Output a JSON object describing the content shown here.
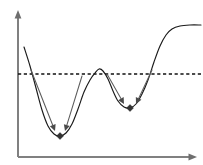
{
  "figure": {
    "width": 203,
    "height": 165,
    "background_color": "#ffffff"
  },
  "axes": {
    "x_axis": {
      "label": "x-axis",
      "color": "#808080",
      "start": [
        18,
        157
      ],
      "end": [
        193,
        157
      ],
      "arrow_head": "right-arrow-icon"
    },
    "y_axis": {
      "label": "y-axis",
      "color": "#808080",
      "start": [
        18,
        157
      ],
      "end": [
        18,
        14
      ],
      "arrow_head": "up-arrow-icon"
    }
  },
  "threshold": {
    "label": "threshold-level",
    "style": "dashed",
    "color": "#111111",
    "y_value": 74,
    "x_start": 18,
    "x_end": 201
  },
  "chart_data": {
    "type": "line",
    "xlabel": "",
    "ylabel": "",
    "grid": false,
    "legend_position": "none",
    "xlim": [
      18,
      201
    ],
    "ylim": [
      157,
      14
    ],
    "series": [
      {
        "name": "objective-function",
        "color": "#1a1a1a",
        "points": [
          [
            24,
            47
          ],
          [
            30,
            66
          ],
          [
            36,
            88
          ],
          [
            42,
            110
          ],
          [
            48,
            126
          ],
          [
            54,
            134
          ],
          [
            60,
            136
          ],
          [
            66,
            133
          ],
          [
            72,
            124
          ],
          [
            78,
            109
          ],
          [
            84,
            92
          ],
          [
            90,
            80
          ],
          [
            95,
            73
          ],
          [
            99,
            69
          ],
          [
            103,
            71
          ],
          [
            108,
            79
          ],
          [
            113,
            91
          ],
          [
            118,
            101
          ],
          [
            124,
            107
          ],
          [
            130,
            108
          ],
          [
            136,
            104
          ],
          [
            142,
            94
          ],
          [
            148,
            80
          ],
          [
            154,
            62
          ],
          [
            160,
            46
          ],
          [
            166,
            35
          ],
          [
            172,
            29
          ],
          [
            180,
            26
          ],
          [
            190,
            25
          ],
          [
            201,
            25
          ]
        ]
      }
    ],
    "markers": [
      {
        "name": "local-minimum-1",
        "x": 60,
        "y": 136,
        "shape": "diamond",
        "color": "#333333"
      },
      {
        "name": "local-minimum-2",
        "x": 130,
        "y": 108,
        "shape": "diamond",
        "color": "#333333"
      }
    ],
    "annotations": [
      {
        "name": "descent-arrow-left-basin-1",
        "from": [
          31,
          70
        ],
        "to": [
          55,
          131
        ],
        "color": "#5c5c5c",
        "direction": "down-right"
      },
      {
        "name": "descent-arrow-right-basin-1",
        "from": [
          82,
          76
        ],
        "to": [
          65,
          131
        ],
        "color": "#5c5c5c",
        "direction": "down-left"
      },
      {
        "name": "descent-arrow-left-basin-2",
        "from": [
          107,
          74
        ],
        "to": [
          124,
          104
        ],
        "color": "#5c5c5c",
        "direction": "down-right"
      },
      {
        "name": "descent-arrow-right-basin-2",
        "from": [
          152,
          70
        ],
        "to": [
          136,
          104
        ],
        "color": "#5c5c5c",
        "direction": "down-left"
      }
    ]
  }
}
